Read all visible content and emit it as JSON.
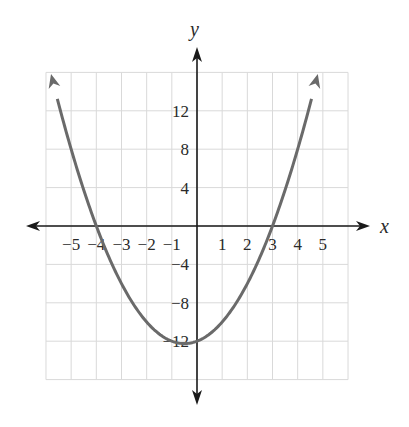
{
  "chart_data": {
    "type": "line",
    "title": "",
    "xlabel": "x",
    "ylabel": "y",
    "function": "y = x^2 + x - 12",
    "roots": [
      -4,
      3
    ],
    "vertex": [
      -0.5,
      -12.25
    ],
    "xlim": [
      -6,
      6
    ],
    "ylim": [
      -16,
      16
    ],
    "grid": true,
    "x_ticks": [
      -5,
      -4,
      -3,
      -2,
      -1,
      1,
      2,
      3,
      4,
      5
    ],
    "x_tick_labels": [
      "−5",
      "−4",
      "−3",
      "−2",
      "−1",
      "1",
      "2",
      "3",
      "4",
      "5"
    ],
    "y_ticks": [
      12,
      8,
      4,
      -4,
      -8,
      -12
    ],
    "y_tick_labels": [
      "12",
      "8",
      "4",
      "−4",
      "−8",
      "−12"
    ],
    "series": [
      {
        "name": "parabola",
        "x": [
          -5.8,
          -5,
          -4,
          -3,
          -2,
          -1,
          -0.5,
          0,
          1,
          2,
          3,
          4,
          4.8
        ],
        "y": [
          15.84,
          8,
          0,
          -6,
          -10,
          -12,
          -12.25,
          -12,
          -10,
          -6,
          0,
          8,
          15.84
        ]
      }
    ],
    "colors": {
      "curve": "#6a6a6a",
      "axis": "#1a1a1a",
      "grid": "#d9d9d9"
    }
  }
}
